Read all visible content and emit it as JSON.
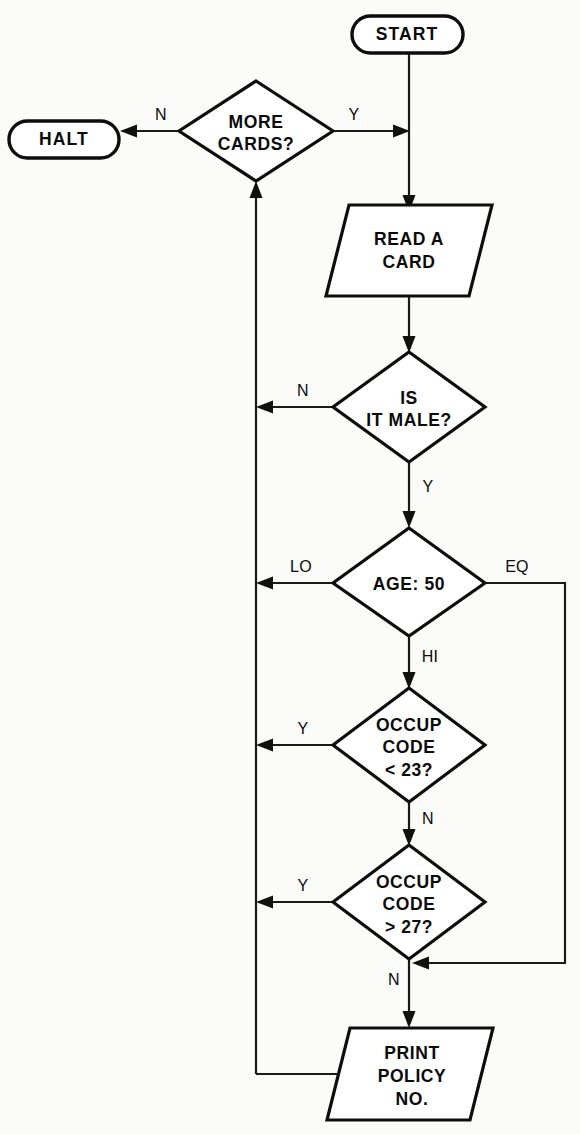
{
  "diagram": {
    "type": "flowchart",
    "canvas": {
      "width": 580,
      "height": 1134
    },
    "line_color": "#101010",
    "fill_color": "#ffffff",
    "background_color": "#fbfbf9"
  },
  "nodes": {
    "start": {
      "label": "START",
      "shape": "terminator",
      "cx": 407,
      "cy": 34,
      "w": 112,
      "h": 37
    },
    "halt": {
      "label": "HALT",
      "shape": "terminator",
      "cx": 64,
      "cy": 139,
      "w": 110,
      "h": 37
    },
    "more_cards": {
      "label_line1": "MORE",
      "label_line2": "CARDS?",
      "shape": "decision",
      "cx": 256,
      "cy": 131,
      "w": 153,
      "h": 100
    },
    "read_card": {
      "label_line1": "READ A",
      "label_line2": "CARD",
      "shape": "parallelogram-input",
      "cx": 409,
      "cy": 250,
      "w": 160,
      "h": 92
    },
    "is_it_male": {
      "label_line1": "IS",
      "label_line2": "IT MALE?",
      "shape": "decision",
      "cx": 409,
      "cy": 407,
      "w": 152,
      "h": 110
    },
    "age_50": {
      "label_line1": "AGE: 50",
      "shape": "decision",
      "cx": 409,
      "cy": 583,
      "w": 152,
      "h": 110
    },
    "occup_lt_23": {
      "label_line1": "OCCUP",
      "label_line2": "CODE",
      "label_line3": "< 23?",
      "shape": "decision",
      "cx": 409,
      "cy": 745,
      "w": 152,
      "h": 114
    },
    "occup_gt_27": {
      "label_line1": "OCCUP",
      "label_line2": "CODE",
      "label_line3": "> 27?",
      "shape": "decision",
      "cx": 409,
      "cy": 902,
      "w": 152,
      "h": 114
    },
    "print_policy": {
      "label_line1": "PRINT",
      "label_line2": "POLICY",
      "label_line3": "NO.",
      "shape": "parallelogram-output",
      "cx": 409,
      "cy": 1072,
      "w": 160,
      "h": 96
    }
  },
  "edge_labels": {
    "more_cards_no": "N",
    "more_cards_yes": "Y",
    "is_it_male_no": "N",
    "is_it_male_yes": "Y",
    "age_lo": "LO",
    "age_eq": "EQ",
    "age_hi": "HI",
    "occup23_yes": "Y",
    "occup23_no": "N",
    "occup27_yes": "Y",
    "occup27_no": "N"
  },
  "flow_description": {
    "edges": [
      {
        "from": "start",
        "to": "more_cards_junction",
        "label": ""
      },
      {
        "from": "more_cards",
        "to": "halt",
        "label": "N"
      },
      {
        "from": "more_cards",
        "to": "read_card",
        "label": "Y"
      },
      {
        "from": "read_card",
        "to": "is_it_male",
        "label": ""
      },
      {
        "from": "is_it_male",
        "to": "return_loop",
        "label": "N"
      },
      {
        "from": "is_it_male",
        "to": "age_50",
        "label": "Y"
      },
      {
        "from": "age_50",
        "to": "return_loop",
        "label": "LO"
      },
      {
        "from": "age_50",
        "to": "print_junction",
        "label": "EQ"
      },
      {
        "from": "age_50",
        "to": "occup_lt_23",
        "label": "HI"
      },
      {
        "from": "occup_lt_23",
        "to": "return_loop",
        "label": "Y"
      },
      {
        "from": "occup_lt_23",
        "to": "occup_gt_27",
        "label": "N"
      },
      {
        "from": "occup_gt_27",
        "to": "return_loop",
        "label": "Y"
      },
      {
        "from": "occup_gt_27",
        "to": "print_policy",
        "label": "N"
      },
      {
        "from": "print_policy",
        "to": "more_cards",
        "label": ""
      }
    ]
  }
}
